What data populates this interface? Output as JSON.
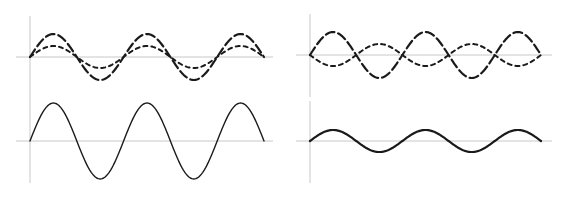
{
  "figure": {
    "colors": {
      "axis": "#c8c8c8",
      "wave": "#1a1a1a",
      "background": "#ffffff"
    }
  },
  "panels": [
    {
      "id": "top-left",
      "title": "",
      "axes": {
        "x0": 30,
        "baseline": 57,
        "yTop": 16,
        "yBottom": 99,
        "hLeft": 16,
        "hRight": 273
      },
      "waves": [
        {
          "name": "wave-a-dashed",
          "style": "dashed",
          "amplitude": 23,
          "phase": 0,
          "xStart": 30,
          "xEnd": 264,
          "periods": 2.5,
          "width": 2.2
        },
        {
          "name": "wave-b-dotted",
          "style": "dotted",
          "amplitude": 11,
          "phase": 0,
          "xStart": 30,
          "xEnd": 264,
          "periods": 2.5,
          "width": 2
        }
      ]
    },
    {
      "id": "top-right",
      "title": "",
      "axes": {
        "x0": 310,
        "baseline": 55,
        "yTop": 14,
        "yBottom": 97,
        "hLeft": 296,
        "hRight": 552
      },
      "waves": [
        {
          "name": "wave-a-dashed",
          "style": "dashed",
          "amplitude": 23,
          "phase": 0,
          "xStart": 310,
          "xEnd": 541,
          "periods": 2.5,
          "width": 2.2
        },
        {
          "name": "wave-b-dotted",
          "style": "dotted",
          "amplitude": 11,
          "phase": 180,
          "xStart": 310,
          "xEnd": 541,
          "periods": 2.5,
          "width": 2
        }
      ]
    },
    {
      "id": "bottom-left",
      "title": "",
      "axes": {
        "x0": 30,
        "baseline": 141,
        "yTop": 99,
        "yBottom": 183,
        "hLeft": 16,
        "hRight": 273
      },
      "waves": [
        {
          "name": "resultant-constructive",
          "style": "solid",
          "amplitude": 38,
          "phase": 0,
          "xStart": 30,
          "xEnd": 264,
          "periods": 2.5,
          "width": 1.4
        }
      ]
    },
    {
      "id": "bottom-right",
      "title": "",
      "axes": {
        "x0": 310,
        "baseline": 141,
        "yTop": 101,
        "yBottom": 183,
        "hLeft": 296,
        "hRight": 552
      },
      "waves": [
        {
          "name": "resultant-destructive",
          "style": "solid",
          "amplitude": 11,
          "phase": 0,
          "xStart": 310,
          "xEnd": 541,
          "periods": 2.5,
          "width": 2.2
        }
      ]
    }
  ]
}
